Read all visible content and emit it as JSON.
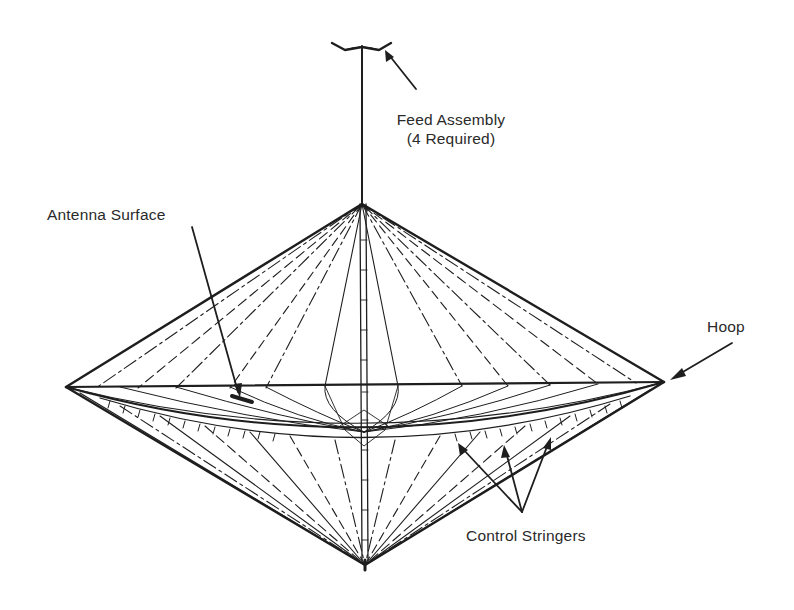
{
  "diagram": {
    "type": "technical-line-drawing",
    "labels": {
      "feed_assembly": "Feed Assembly",
      "feed_assembly_note": "(4 Required)",
      "antenna_surface": "Antenna Surface",
      "hoop": "Hoop",
      "control_stringers": "Control Stringers"
    },
    "colors": {
      "line": "#1e1e1e",
      "text": "#2a2a2a",
      "background": "#ffffff"
    },
    "geometry": {
      "top_apex": [
        362,
        204
      ],
      "bottom_apex": [
        365,
        565
      ],
      "hoop_left": [
        66,
        387
      ],
      "hoop_right": [
        664,
        382
      ],
      "mast_top": [
        362,
        46
      ]
    }
  }
}
